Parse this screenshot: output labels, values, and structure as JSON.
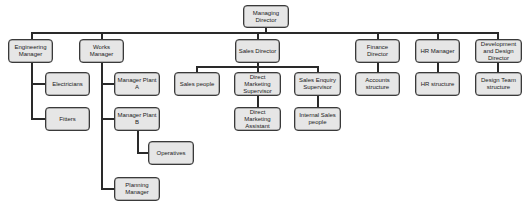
{
  "org_chart": {
    "root": "Managing Director",
    "level1": {
      "engineering_manager": "Engineering Manager",
      "works_manager": "Works Manager",
      "sales_director": "Sales Director",
      "finance_director": "Finance Director",
      "hr_manager": "HR Manager",
      "dev_design_director": "Development and Design Director"
    },
    "engineering": {
      "electricians": "Electricians",
      "fitters": "Fitters"
    },
    "works": {
      "manager_plant_a": "Manager Plant A",
      "manager_plant_b": "Manager Plant B",
      "operatives": "Operatives",
      "planning_manager": "Planning Manager"
    },
    "sales": {
      "sales_people": "Sales people",
      "direct_marketing_supervisor": "Direct Marketing Supervisor",
      "sales_enquiry_supervisor": "Sales Enquiry Supervisor",
      "direct_marketing_assistant": "Direct Marketing Assistant",
      "internal_sales_people": "Internal Sales people"
    },
    "finance": {
      "accounts_structure": "Accounts structure"
    },
    "hr": {
      "hr_structure": "HR structure"
    },
    "dev": {
      "design_team_structure": "Design Team structure"
    }
  }
}
